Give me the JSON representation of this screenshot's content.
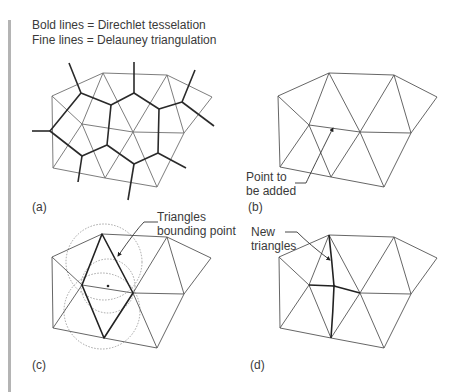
{
  "legend": {
    "line1": "Bold lines = Direchlet tesselation",
    "line2": "Fine lines = Delauney triangulation"
  },
  "panels": [
    {
      "id": "a",
      "label": "(a)"
    },
    {
      "id": "b",
      "label": "(b)",
      "annotation_line1": "Point to",
      "annotation_line2": "be added"
    },
    {
      "id": "c",
      "label": "(c)",
      "annotation_line1": "Triangles",
      "annotation_line2": "bounding point"
    },
    {
      "id": "d",
      "label": "(d)",
      "annotation_line1": "New",
      "annotation_line2": "triangles"
    }
  ],
  "colors": {
    "fine_line": "#6e6e6e",
    "bold_line": "#2a2a2a",
    "circle": "#9a9a9a",
    "side_bar": "#b4b4b4"
  }
}
